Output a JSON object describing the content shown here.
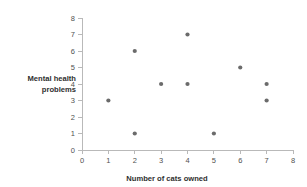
{
  "chart_data": {
    "type": "scatter",
    "title": "",
    "xlabel": "Number of cats owned",
    "ylabel": "Mental health problems",
    "ylabel_lines": [
      "Mental health",
      "problems"
    ],
    "xlim": [
      0,
      8
    ],
    "ylim": [
      0,
      8
    ],
    "xticks": [
      0,
      1,
      2,
      3,
      4,
      5,
      6,
      7,
      8
    ],
    "yticks": [
      0,
      1,
      2,
      3,
      4,
      5,
      6,
      7,
      8
    ],
    "xtick_labels": [
      "0",
      "1",
      "2",
      "3",
      "4",
      "5",
      "6",
      "7",
      "8"
    ],
    "ytick_labels": [
      "0",
      "1",
      "2",
      "3",
      "4",
      "5",
      "6",
      "7",
      "8"
    ],
    "grid": false,
    "legend": false,
    "marker_color": "#6b6b6b",
    "axis_color": "#b9b9b9",
    "background_color": "#ffffff",
    "points": [
      {
        "x": 1,
        "y": 3
      },
      {
        "x": 2,
        "y": 6
      },
      {
        "x": 2,
        "y": 1
      },
      {
        "x": 3,
        "y": 4
      },
      {
        "x": 4,
        "y": 7
      },
      {
        "x": 4,
        "y": 4
      },
      {
        "x": 5,
        "y": 1
      },
      {
        "x": 6,
        "y": 5
      },
      {
        "x": 7,
        "y": 4
      },
      {
        "x": 7,
        "y": 3
      }
    ],
    "x": [
      1,
      2,
      2,
      3,
      4,
      4,
      5,
      6,
      7,
      7
    ],
    "values": [
      3,
      6,
      1,
      4,
      7,
      4,
      1,
      5,
      4,
      3
    ]
  }
}
